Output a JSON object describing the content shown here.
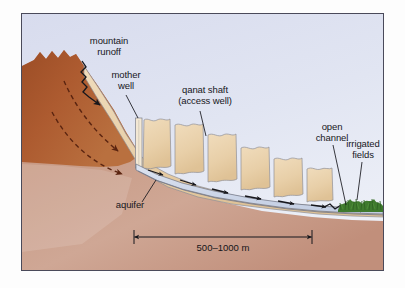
{
  "figure": {
    "kind": "cross-section-diagram",
    "background_sky_color": "#dfe3f0",
    "frame_border_color": "#4a4a5a",
    "page_background": "#ffffff"
  },
  "labels": {
    "mountain_runoff": "mountain\nrunoff",
    "mountain_runoff_line1": "mountain",
    "mountain_runoff_line2": "runoff",
    "mother_well": "mother\nwell",
    "mother_well_line1": "mother",
    "mother_well_line2": "well",
    "qanat_shaft": "qanat shaft\n(access well)",
    "qanat_shaft_line1": "qanat shaft",
    "qanat_shaft_line2": "(access well)",
    "open_channel": "open\nchannel",
    "open_channel_line1": "open",
    "open_channel_line2": "channel",
    "irrigated_fields": "irrigated\nfields",
    "irrigated_fields_line1": "irrigated",
    "irrigated_fields_line2": "fields",
    "aquifer": "aquifer"
  },
  "scale_bar": {
    "text": "500–1000 m",
    "min_m": 500,
    "max_m": 1000,
    "unit": "m"
  },
  "colors": {
    "sky": "#dfe3f0",
    "mountain_rock_upper": "#a8562c",
    "mountain_rock_mid": "#b4673a",
    "bedrock_lower": "#c49a88",
    "alluvium_tan": "#e8cfa8",
    "alluvium_outline": "#8f8f96",
    "channel_water": "#ccd6e8",
    "channel_outline": "#6f7382",
    "vegetation_green": "#3f7a2e",
    "arrow_black": "#17171c",
    "dashed_flow_arrow": "#5a2410"
  },
  "elements": {
    "shaft_count": 6,
    "flow_arrow_count": 6,
    "groundwater_dashed_arrows": 2,
    "runoff_squiggle": "zigzag arrow pointing downslope into the alluvium"
  }
}
